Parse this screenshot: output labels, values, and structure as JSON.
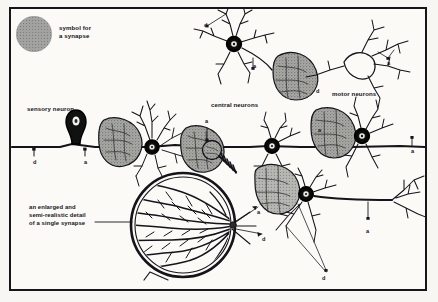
{
  "figure": {
    "background_color": "#fbfaf7",
    "frame_color": "#16161a",
    "ink_color": "#14141a",
    "synapse_gray": "#9b9b99"
  },
  "legend": {
    "symbol_name": "synapse-symbol-dot",
    "color": "#a2a2a0",
    "text_line1": "symbol for",
    "text_line2": "a synapse"
  },
  "labels": {
    "sensory_neuron": "sensory neuron",
    "central_neurons": "central neurons",
    "motor_neurons": "motor neurons"
  },
  "caption": {
    "line1": "an enlarged and",
    "line2": "semi-realistic detail",
    "line3": "of a single synapse"
  },
  "markers": [
    {
      "id": "m1",
      "letter": "d",
      "x": 33,
      "y": 159
    },
    {
      "id": "m2",
      "letter": "a",
      "x": 84,
      "y": 159
    },
    {
      "id": "m3",
      "letter": "a",
      "x": 205,
      "y": 118
    },
    {
      "id": "m4",
      "letter": "d",
      "x": 204,
      "y": 22
    },
    {
      "id": "m5",
      "letter": "a",
      "x": 253,
      "y": 63
    },
    {
      "id": "m6",
      "letter": "d",
      "x": 316,
      "y": 88
    },
    {
      "id": "m7",
      "letter": "a",
      "x": 318,
      "y": 127
    },
    {
      "id": "m8",
      "letter": "a",
      "x": 411,
      "y": 148
    },
    {
      "id": "m9",
      "letter": "a",
      "x": 366,
      "y": 228
    },
    {
      "id": "m10",
      "letter": "d",
      "x": 322,
      "y": 275
    },
    {
      "id": "m11",
      "letter": "a",
      "x": 257,
      "y": 209
    },
    {
      "id": "m12",
      "letter": "d",
      "x": 262,
      "y": 236
    },
    {
      "id": "m13",
      "letter": "a",
      "x": 387,
      "y": 60
    }
  ],
  "structures": {
    "sensory_neuron_soma": "teardrop-shaped sensory cell body on the main axon line",
    "main_axon_line": "horizontal axon running across the middle of the plate",
    "enlarged_synapse_circle": "large circle lower-centre showing dense branching terminal",
    "magnifier_stripe": "striped connector from small synapse to enlarged circle",
    "neuron_count": 7
  }
}
